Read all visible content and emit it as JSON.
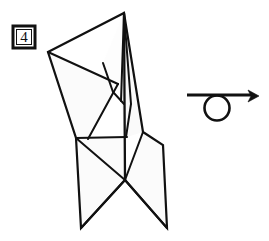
{
  "diagram": {
    "kind": "origami-fold-diagram",
    "step_label": "4",
    "background_color": "#ffffff",
    "stroke_color": "#111111",
    "paper_fill": "#fbfbfb",
    "paper_fill_shaded": "#f7f7f7",
    "step_box": {
      "label": "4",
      "x": 13,
      "y": 26,
      "width": 22,
      "height": 22,
      "border_width": 3,
      "inner_gap": 2
    },
    "turn_over_arrow": {
      "symbol_name": "turn-over-arrow",
      "line_start_x": 187,
      "line_start_y": 95,
      "line_end_x": 252,
      "line_end_y": 95,
      "tip_x": 258,
      "tip_y": 96,
      "circle_cx": 217,
      "circle_cy": 108,
      "circle_r": 12.5,
      "stroke_width": 2.6
    },
    "model": {
      "name": "folded-paper-model",
      "apex_x": 124,
      "apex_y": 13,
      "left_wing_tip_x": 48,
      "left_wing_tip_y": 52,
      "crossing_x": 125,
      "crossing_y": 180,
      "bottom_left_x": 81,
      "bottom_left_y": 228,
      "bottom_right_x": 167,
      "bottom_right_y": 228,
      "waist_left_x": 76,
      "waist_left_y": 138,
      "waist_right_x": 127,
      "waist_right_y": 137,
      "right_hip_x": 163,
      "right_hip_y": 145,
      "right_shoulder_x": 143,
      "right_hip_top_y": 132,
      "facets": [
        {
          "name": "left-upper-wing",
          "points": "48,52 118,84 112,95 88,139 76,138"
        },
        {
          "name": "left-inner-flap",
          "points": "103,63 124,13 122,100 113,92"
        },
        {
          "name": "center-spike",
          "points": "124,13 131,103 125,137 121,100"
        },
        {
          "name": "right-upper-panel",
          "points": "124,13 143,132 127,137 126,60"
        },
        {
          "name": "waist-quad",
          "points": "76,138 127,137 125,180 76,138"
        },
        {
          "name": "right-hip-panel",
          "points": "143,132 163,145 167,228 125,180 126,140"
        },
        {
          "name": "left-leg",
          "points": "76,138 125,180 81,228"
        },
        {
          "name": "right-leg",
          "points": "125,180 167,228 130,200"
        }
      ],
      "outline": "48,52 124,13 143,132 163,145 167,228 125,180 81,228 76,138",
      "crease_lines": [
        {
          "name": "crease-left-wing-inner",
          "from": [
            48,
            52
          ],
          "to": [
            118,
            84
          ]
        },
        {
          "name": "crease-left-wing-lower",
          "from": [
            118,
            84
          ],
          "to": [
            88,
            139
          ]
        },
        {
          "name": "crease-center-left",
          "from": [
            124,
            13
          ],
          "to": [
            121,
            100
          ]
        },
        {
          "name": "crease-center-spine",
          "from": [
            124,
            13
          ],
          "to": [
            125,
            180
          ]
        },
        {
          "name": "crease-inner-valley",
          "from": [
            103,
            63
          ],
          "to": [
            124,
            103
          ]
        },
        {
          "name": "crease-waist",
          "from": [
            76,
            138
          ],
          "to": [
            127,
            137
          ]
        },
        {
          "name": "crease-waist-diagonal",
          "from": [
            76,
            138
          ],
          "to": [
            125,
            180
          ]
        },
        {
          "name": "crease-right-hip-edge",
          "from": [
            143,
            132
          ],
          "to": [
            125,
            180
          ]
        },
        {
          "name": "crease-left-leg-outer",
          "from": [
            125,
            180
          ],
          "to": [
            81,
            228
          ]
        },
        {
          "name": "crease-right-leg-outer",
          "from": [
            125,
            180
          ],
          "to": [
            167,
            228
          ]
        }
      ]
    }
  }
}
